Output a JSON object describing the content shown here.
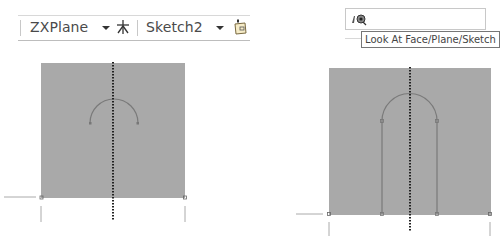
{
  "toolbar_left": {
    "plane_combo": {
      "value": "ZXPlane",
      "icon": "chevron-down-icon"
    },
    "axis_icon": "asterisk-axis-icon",
    "sketch_combo": {
      "value": "Sketch2",
      "icon": "chevron-down-icon"
    },
    "sketch_icon": "new-sketch-icon"
  },
  "toolbar_right": {
    "look_at_icon": "look-at-icon",
    "tooltip": "Look At Face/Plane/Sketch"
  },
  "viewports": [
    {
      "name": "left-sketch-view",
      "fill": "#a9a9a9",
      "shape": "arc"
    },
    {
      "name": "right-sketch-view",
      "fill": "#a9a9a9",
      "shape": "arch-with-legs"
    }
  ],
  "colors": {
    "plane_fill": "#a8a8a8",
    "sketch_line": "#7a7a7a",
    "axis_dotted": "#222222",
    "toolbar_border": "#c8c8c8"
  }
}
